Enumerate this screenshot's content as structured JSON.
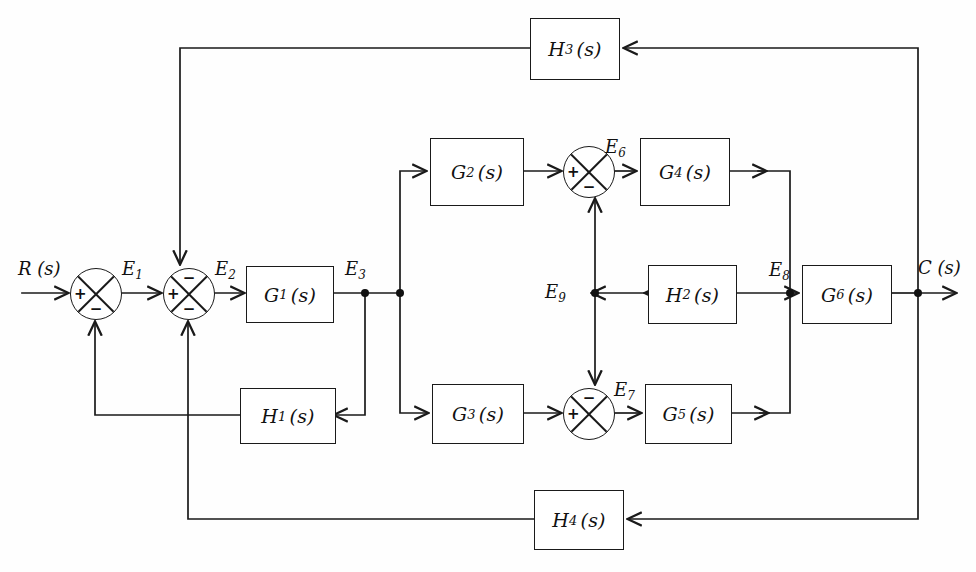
{
  "diagram": {
    "type": "control-system-block-diagram",
    "canvas": {
      "width": 976,
      "height": 572
    },
    "stroke_color": "#1a1a1a",
    "background_color": "#ffffff"
  },
  "signals": {
    "input": {
      "name": "R",
      "arg": "(s)",
      "label": "R (s)"
    },
    "output": {
      "name": "C",
      "arg": "(s)",
      "label": "C (s)"
    },
    "e1": {
      "name": "E",
      "sub": "1"
    },
    "e2": {
      "name": "E",
      "sub": "2"
    },
    "e3": {
      "name": "E",
      "sub": "3"
    },
    "e6": {
      "name": "E",
      "sub": "6"
    },
    "e7": {
      "name": "E",
      "sub": "7"
    },
    "e8": {
      "name": "E",
      "sub": "8"
    },
    "e9": {
      "name": "E",
      "sub": "9"
    }
  },
  "blocks": [
    {
      "id": "G1",
      "name": "G",
      "sub": "1",
      "arg": "(s)",
      "label": "G1(s)"
    },
    {
      "id": "G2",
      "name": "G",
      "sub": "2",
      "arg": "(s)",
      "label": "G2(s)"
    },
    {
      "id": "G3",
      "name": "G",
      "sub": "3",
      "arg": "(s)",
      "label": "G3(s)"
    },
    {
      "id": "G4",
      "name": "G",
      "sub": "4",
      "arg": "(s)",
      "label": "G4(s)"
    },
    {
      "id": "G5",
      "name": "G",
      "sub": "5",
      "arg": "(s)",
      "label": "G5(s)"
    },
    {
      "id": "G6",
      "name": "G",
      "sub": "6",
      "arg": "(s)",
      "label": "G6(s)"
    },
    {
      "id": "H1",
      "name": "H",
      "sub": "1",
      "arg": "(s)",
      "label": "H1(s)"
    },
    {
      "id": "H2",
      "name": "H",
      "sub": "2",
      "arg": "(s)",
      "label": "H2(s)"
    },
    {
      "id": "H3",
      "name": "H",
      "sub": "3",
      "arg": "(s)",
      "label": "H3(s)"
    },
    {
      "id": "H4",
      "name": "H",
      "sub": "4",
      "arg": "(s)",
      "label": "H4(s)"
    }
  ],
  "summing_junctions": [
    {
      "id": "S1",
      "left_sign": "+",
      "bottom_sign": "−",
      "top_sign": "",
      "right_sign": ""
    },
    {
      "id": "S2",
      "left_sign": "+",
      "bottom_sign": "−",
      "top_sign": "−",
      "right_sign": ""
    },
    {
      "id": "S6",
      "left_sign": "+",
      "bottom_sign": "−",
      "top_sign": "",
      "right_sign": ""
    },
    {
      "id": "S7",
      "left_sign": "+",
      "bottom_sign": "",
      "top_sign": "−",
      "right_sign": ""
    }
  ],
  "nodes": [
    {
      "id": "N_E3a",
      "label": "E3 take-off to H1"
    },
    {
      "id": "N_E3b",
      "label": "E3 branch to G2 and G3"
    },
    {
      "id": "N_E9",
      "label": "E9 split to S6 and S7"
    },
    {
      "id": "N_E8",
      "label": "E8 split to H2 and G6"
    },
    {
      "id": "N_C",
      "label": "C(s) split to H3 and H4"
    }
  ]
}
